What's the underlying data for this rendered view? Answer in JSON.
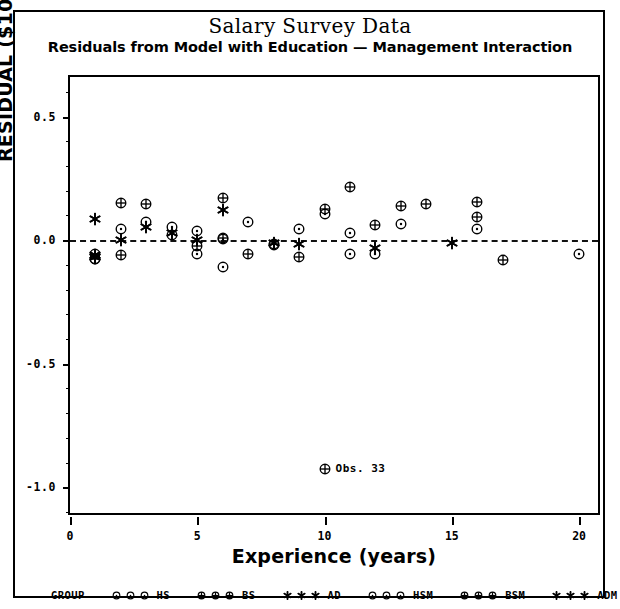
{
  "chart_data": {
    "type": "scatter",
    "title": "Salary Survey Data",
    "subtitle": "Residuals from Model with Education — Management Interaction",
    "xlabel": "Experience (years)",
    "ylabel": "RESIDUAL ($1000s)",
    "xlim": [
      0,
      20.9
    ],
    "ylim": [
      -1.12,
      0.66
    ],
    "xticks": [
      0,
      5,
      10,
      15,
      20
    ],
    "xtick_labels": [
      "0",
      "5",
      "10",
      "15",
      "20"
    ],
    "yticks": [
      0.5,
      0.0,
      -0.5,
      -1.0
    ],
    "ytick_labels": [
      "0.5",
      "0.0",
      "-0.5",
      "-1.0"
    ],
    "grid": false,
    "reference_line": {
      "y": 0.0,
      "style": "dashed"
    },
    "legend_position": "below-axes",
    "annotations": [
      {
        "text": "Obs. 33",
        "x": 10.0,
        "y": -0.925,
        "symbol": "circle-plus"
      }
    ],
    "series": [
      {
        "name": "HS",
        "label": "HS",
        "symbol": "circle-dot",
        "points": [
          {
            "x": 1.0,
            "y": -0.055
          },
          {
            "x": 1.0,
            "y": -0.075
          },
          {
            "x": 2.0,
            "y": 0.045
          },
          {
            "x": 3.0,
            "y": 0.075
          },
          {
            "x": 4.0,
            "y": 0.055
          },
          {
            "x": 4.0,
            "y": 0.02
          },
          {
            "x": 5.0,
            "y": 0.035
          },
          {
            "x": 6.0,
            "y": 0.005
          },
          {
            "x": 7.0,
            "y": 0.075
          },
          {
            "x": 8.0,
            "y": -0.02
          },
          {
            "x": 9.0,
            "y": 0.045
          },
          {
            "x": 10.0,
            "y": 0.105
          },
          {
            "x": 11.0,
            "y": 0.03
          },
          {
            "x": 12.0,
            "y": -0.055
          },
          {
            "x": 13.0,
            "y": 0.065
          },
          {
            "x": 16.0,
            "y": 0.045
          },
          {
            "x": 20.0,
            "y": -0.055
          }
        ]
      },
      {
        "name": "BS",
        "label": "BS",
        "symbol": "circle-plus",
        "points": [
          {
            "x": 1.0,
            "y": -0.075
          },
          {
            "x": 2.0,
            "y": 0.15
          },
          {
            "x": 2.0,
            "y": -0.06
          },
          {
            "x": 3.0,
            "y": 0.145
          },
          {
            "x": 5.0,
            "y": -0.025
          },
          {
            "x": 6.0,
            "y": 0.17
          },
          {
            "x": 6.0,
            "y": 0.01
          },
          {
            "x": 8.0,
            "y": -0.015
          },
          {
            "x": 9.0,
            "y": -0.07
          },
          {
            "x": 10.0,
            "y": 0.125
          },
          {
            "x": 11.0,
            "y": 0.215
          },
          {
            "x": 12.0,
            "y": 0.06
          },
          {
            "x": 13.0,
            "y": 0.14
          },
          {
            "x": 14.0,
            "y": 0.145
          },
          {
            "x": 16.0,
            "y": 0.155
          },
          {
            "x": 16.0,
            "y": 0.095
          },
          {
            "x": 17.0,
            "y": -0.08
          },
          {
            "x": 10.0,
            "y": -0.925
          }
        ]
      },
      {
        "name": "AD",
        "label": "AD",
        "symbol": "asterisk",
        "points": [
          {
            "x": 1.0,
            "y": 0.085
          },
          {
            "x": 1.0,
            "y": -0.06
          },
          {
            "x": 2.0,
            "y": 0.0
          },
          {
            "x": 3.0,
            "y": 0.055
          },
          {
            "x": 4.0,
            "y": 0.03
          },
          {
            "x": 5.0,
            "y": 0.0
          },
          {
            "x": 6.0,
            "y": 0.12
          },
          {
            "x": 8.0,
            "y": -0.01
          },
          {
            "x": 9.0,
            "y": -0.015
          },
          {
            "x": 12.0,
            "y": -0.03
          },
          {
            "x": 15.0,
            "y": -0.01
          }
        ]
      },
      {
        "name": "HSM",
        "label": "HSM",
        "symbol": "circle-dot",
        "points": [
          {
            "x": 5.0,
            "y": -0.055
          },
          {
            "x": 6.0,
            "y": -0.11
          },
          {
            "x": 11.0,
            "y": -0.055
          }
        ]
      },
      {
        "name": "BSM",
        "label": "BSM",
        "symbol": "circle-plus",
        "points": [
          {
            "x": 7.0,
            "y": -0.055
          }
        ]
      },
      {
        "name": "ADM",
        "label": "ADM",
        "symbol": "asterisk",
        "points": [
          {
            "x": 1.0,
            "y": -0.07
          }
        ]
      }
    ]
  },
  "legend": {
    "group_label": "GROUP",
    "entries": [
      {
        "label": "HS",
        "symbol": "circle-dot",
        "count": 3
      },
      {
        "label": "BS",
        "symbol": "circle-plus",
        "count": 3
      },
      {
        "label": "AD",
        "symbol": "asterisk",
        "count": 3
      },
      {
        "label": "HSM",
        "symbol": "circle-dot",
        "count": 3
      },
      {
        "label": "BSM",
        "symbol": "circle-plus",
        "count": 3
      },
      {
        "label": "ADM",
        "symbol": "asterisk",
        "count": 3
      }
    ]
  },
  "colors": {
    "ink": "#000000",
    "background": "#ffffff"
  }
}
